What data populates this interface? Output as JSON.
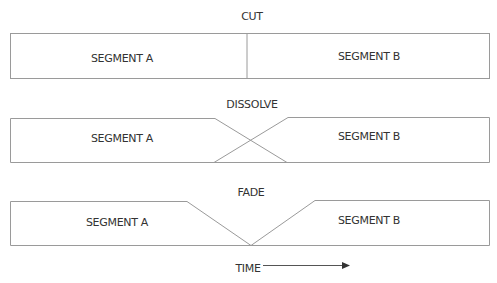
{
  "diagrams": {
    "cut": {
      "title": "CUT",
      "segment_a": "SEGMENT A",
      "segment_b": "SEGMENT B"
    },
    "dissolve": {
      "title": "DISSOLVE",
      "segment_a": "SEGMENT A",
      "segment_b": "SEGMENT B"
    },
    "fade": {
      "title": "FADE",
      "segment_a": "SEGMENT A",
      "segment_b": "SEGMENT B"
    }
  },
  "axis": {
    "label": "TIME",
    "arrow_icon": "right-arrow-icon"
  },
  "colors": {
    "line": "#9a9a9a",
    "text": "#333333"
  }
}
